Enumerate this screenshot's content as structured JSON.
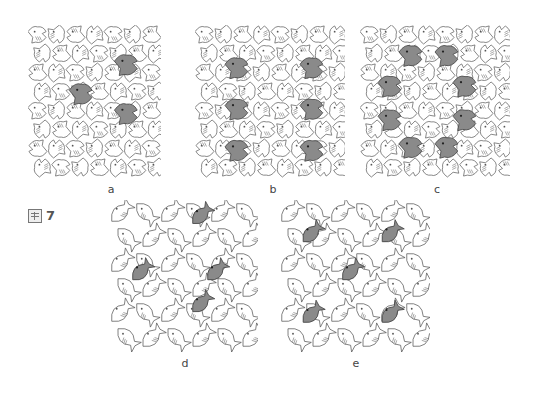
{
  "figure": {
    "label_char": "圖",
    "number": "7"
  },
  "panels": [
    {
      "id": "a",
      "label": "a",
      "motif": "birds",
      "x": 28,
      "y": 25,
      "w": 133,
      "h": 153,
      "highlights": [
        [
          0.4,
          0.45
        ],
        [
          0.74,
          0.26
        ],
        [
          0.74,
          0.58
        ]
      ]
    },
    {
      "id": "b",
      "label": "b",
      "motif": "birds",
      "x": 195,
      "y": 25,
      "w": 150,
      "h": 153,
      "highlights": [
        [
          0.28,
          0.28
        ],
        [
          0.78,
          0.28
        ],
        [
          0.28,
          0.55
        ],
        [
          0.78,
          0.55
        ],
        [
          0.28,
          0.82
        ],
        [
          0.78,
          0.82
        ]
      ]
    },
    {
      "id": "c",
      "label": "c",
      "motif": "birds",
      "x": 360,
      "y": 25,
      "w": 150,
      "h": 153,
      "highlights": [
        [
          0.34,
          0.2
        ],
        [
          0.58,
          0.2
        ],
        [
          0.2,
          0.4
        ],
        [
          0.7,
          0.4
        ],
        [
          0.2,
          0.62
        ],
        [
          0.7,
          0.62
        ],
        [
          0.34,
          0.8
        ],
        [
          0.58,
          0.8
        ]
      ]
    },
    {
      "id": "d",
      "label": "d",
      "motif": "fish",
      "x": 108,
      "y": 200,
      "w": 150,
      "h": 152,
      "highlights": [
        [
          0.62,
          0.1
        ],
        [
          0.22,
          0.47
        ],
        [
          0.72,
          0.47
        ],
        [
          0.62,
          0.68
        ]
      ]
    },
    {
      "id": "e",
      "label": "e",
      "motif": "fish",
      "x": 278,
      "y": 200,
      "w": 152,
      "h": 152,
      "highlights": [
        [
          0.22,
          0.22
        ],
        [
          0.74,
          0.22
        ],
        [
          0.48,
          0.47
        ],
        [
          0.22,
          0.75
        ],
        [
          0.74,
          0.75
        ]
      ]
    }
  ],
  "colors": {
    "line": "#555555",
    "highlight": "#8a8a8a",
    "background": "#ffffff"
  },
  "labels": {
    "a": {
      "x": 101,
      "y": 183
    },
    "b": {
      "x": 263,
      "y": 183
    },
    "c": {
      "x": 427,
      "y": 183
    },
    "d": {
      "x": 175,
      "y": 357
    },
    "e": {
      "x": 346,
      "y": 357
    }
  }
}
